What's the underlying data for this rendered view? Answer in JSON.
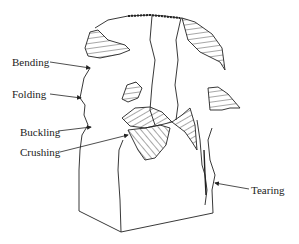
{
  "figure": {
    "type": "failure-modes-diagram",
    "line_color": "#222222",
    "background": "#ffffff"
  },
  "labels": [
    {
      "id": "bending",
      "text": "Bending",
      "x": 12,
      "y": 56,
      "arrow_from": [
        50,
        62
      ],
      "arrow_to": [
        90,
        68
      ]
    },
    {
      "id": "folding",
      "text": "Folding",
      "x": 12,
      "y": 88,
      "arrow_from": [
        50,
        94
      ],
      "arrow_to": [
        81,
        98
      ]
    },
    {
      "id": "buckling",
      "text": "Buckling",
      "x": 20,
      "y": 126,
      "arrow_from": [
        58,
        131
      ],
      "arrow_to": [
        91,
        127
      ]
    },
    {
      "id": "crushing",
      "text": "Crushing",
      "x": 20,
      "y": 146,
      "arrow_from": [
        60,
        152
      ],
      "arrow_to": [
        128,
        135
      ]
    },
    {
      "id": "tearing",
      "text": "Tearing",
      "x": 251,
      "y": 184,
      "arrow_from": [
        249,
        189
      ],
      "arrow_to": [
        215,
        183
      ]
    }
  ]
}
